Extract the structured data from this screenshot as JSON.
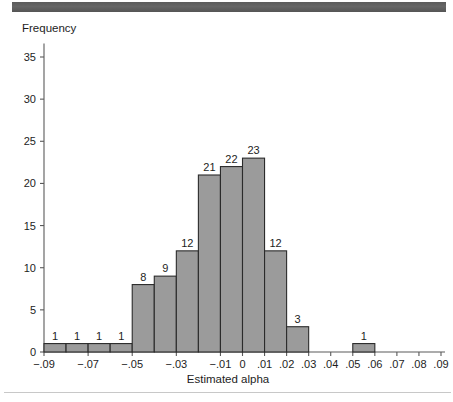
{
  "figure": {
    "banner_color": "#5b5b5b",
    "background_color": "#ffffff",
    "bar_fill_color": "#9b9b9b",
    "bar_stroke_color": "#2b2b2b",
    "axis_color": "#5a5a5a"
  },
  "chart_data": {
    "type": "bar",
    "title": "",
    "subtitle": "",
    "xlabel": "Estimated alpha",
    "ylabel": "Frequency",
    "grid": false,
    "legend": null,
    "ylim": [
      0,
      37
    ],
    "ytick_values": [
      0,
      5,
      10,
      15,
      20,
      25,
      30,
      35
    ],
    "ytick_labels": [
      "0",
      "5",
      "10",
      "15",
      "20",
      "25",
      "30",
      "35"
    ],
    "xlim": [
      -0.095,
      0.095
    ],
    "xtick_values": [
      -0.09,
      -0.07,
      -0.05,
      -0.03,
      -0.01,
      0.0,
      0.01,
      0.02,
      0.03,
      0.04,
      0.05,
      0.06,
      0.07,
      0.08,
      0.09
    ],
    "xtick_labels": [
      "−.09",
      "−.07",
      "−.05",
      "−.03",
      "−.01",
      "0",
      ".01",
      ".02",
      ".03",
      ".04",
      ".05",
      ".06",
      ".07",
      ".08",
      ".09"
    ],
    "bin_width": 0.01,
    "bin_edges": [
      -0.09,
      -0.08,
      -0.07,
      -0.06,
      -0.05,
      -0.04,
      -0.03,
      -0.02,
      -0.01,
      0.0,
      0.01,
      0.02,
      0.03,
      0.05,
      0.06
    ],
    "categories": [
      "−.09 to −.08",
      "−.08 to −.07",
      "−.07 to −.06",
      "−.06 to −.05",
      "−.05 to −.04",
      "−.04 to −.03",
      "−.03 to −.02",
      "−.02 to −.01",
      "−.01 to 0",
      "0 to .01",
      ".01 to .02",
      ".02 to .03",
      ".05 to .06"
    ],
    "values": [
      1,
      1,
      1,
      1,
      8,
      9,
      12,
      21,
      22,
      23,
      12,
      3,
      1
    ],
    "bars": [
      {
        "x0": -0.09,
        "x1": -0.08,
        "value": 1,
        "label": "1"
      },
      {
        "x0": -0.08,
        "x1": -0.07,
        "value": 1,
        "label": "1"
      },
      {
        "x0": -0.07,
        "x1": -0.06,
        "value": 1,
        "label": "1"
      },
      {
        "x0": -0.06,
        "x1": -0.05,
        "value": 1,
        "label": "1"
      },
      {
        "x0": -0.05,
        "x1": -0.04,
        "value": 8,
        "label": "8"
      },
      {
        "x0": -0.04,
        "x1": -0.03,
        "value": 9,
        "label": "9"
      },
      {
        "x0": -0.03,
        "x1": -0.02,
        "value": 12,
        "label": "12"
      },
      {
        "x0": -0.02,
        "x1": -0.01,
        "value": 21,
        "label": "21"
      },
      {
        "x0": -0.01,
        "x1": 0.0,
        "value": 22,
        "label": "22"
      },
      {
        "x0": 0.0,
        "x1": 0.01,
        "value": 23,
        "label": "23"
      },
      {
        "x0": 0.01,
        "x1": 0.02,
        "value": 12,
        "label": "12"
      },
      {
        "x0": 0.02,
        "x1": 0.03,
        "value": 3,
        "label": "3"
      },
      {
        "x0": 0.05,
        "x1": 0.06,
        "value": 1,
        "label": "1"
      }
    ],
    "total_count": 115
  }
}
